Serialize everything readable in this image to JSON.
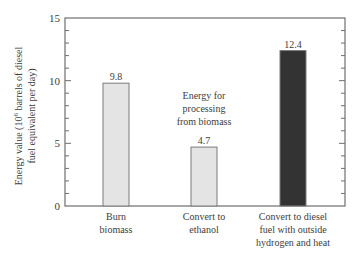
{
  "chart_data": {
    "type": "bar",
    "title": "",
    "xlabel": "",
    "ylabel": "Energy value (10^6 barrels of diesel fuel equivalent per day)",
    "ylabel_lines": [
      "Energy value (10",
      "6",
      " barrels of diesel",
      "fuel equivalent per day)"
    ],
    "ylim": [
      0,
      15
    ],
    "yticks": [
      0,
      5,
      10,
      15
    ],
    "minor_tick_step": 1,
    "grid": false,
    "categories": [
      "Burn biomass",
      "Convert to ethanol",
      "Convert to diesel fuel with outside hydrogen and heat"
    ],
    "category_label_lines": [
      [
        "Burn",
        "biomass"
      ],
      [
        "Convert to",
        "ethanol"
      ],
      [
        "Convert to diesel",
        "fuel with outside",
        "hydrogen and heat"
      ]
    ],
    "values": [
      9.8,
      4.7,
      12.4
    ],
    "value_labels": [
      "9.8",
      "4.7",
      "12.4"
    ],
    "bar_colors": [
      "#e4e4e4",
      "#e4e4e4",
      "#333333"
    ],
    "annotation": {
      "text": "Energy for processing from biomass",
      "lines": [
        "Energy for",
        "processing",
        "from biomass"
      ]
    }
  },
  "style": {
    "axis_color": "#6e6e6e",
    "bar_border": "#7a7a7a",
    "text_color": "#3d3d3d"
  }
}
